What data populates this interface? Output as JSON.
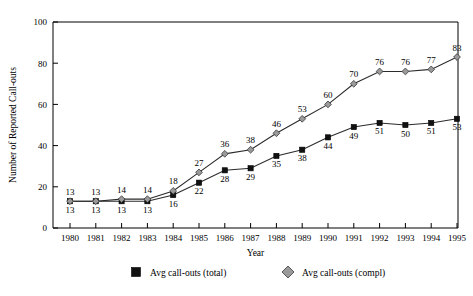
{
  "chart_data": {
    "type": "line",
    "title": "",
    "xlabel": "Year",
    "ylabel": "Number of Reported Call-outs",
    "categories": [
      "1980",
      "1981",
      "1982",
      "1983",
      "1984",
      "1985",
      "1986",
      "1987",
      "1988",
      "1989",
      "1990",
      "1991",
      "1992",
      "1993",
      "1994",
      "1995"
    ],
    "x": [
      1980,
      1981,
      1982,
      1983,
      1984,
      1985,
      1986,
      1987,
      1988,
      1989,
      1990,
      1991,
      1992,
      1993,
      1994,
      1995
    ],
    "xlim": [
      1979.5,
      1995.8
    ],
    "ylim": [
      0,
      100
    ],
    "yticks": [
      0,
      20,
      40,
      60,
      80,
      100
    ],
    "ytick_labels": [
      "0",
      "20",
      "40",
      "60",
      "80",
      "100"
    ],
    "grid": false,
    "legend_position": "bottom",
    "series": [
      {
        "name": "Avg call-outs (total)",
        "marker": "square",
        "marker_color": "#111111",
        "label_position": "below",
        "values": [
          13,
          13,
          13,
          13,
          16,
          22,
          28,
          29,
          35,
          38,
          44,
          49,
          51,
          50,
          51,
          53
        ]
      },
      {
        "name": "Avg call-outs (compl)",
        "marker": "diamond",
        "marker_color": "#9a9a9a",
        "label_position": "above",
        "values": [
          13,
          13,
          14,
          14,
          18,
          27,
          36,
          38,
          46,
          53,
          60,
          70,
          76,
          76,
          77,
          83
        ]
      }
    ]
  },
  "legend": {
    "entries": [
      {
        "label": "Avg call-outs (total)",
        "marker": "square",
        "color": "#111111"
      },
      {
        "label": "Avg call-outs (compl)",
        "marker": "diamond",
        "color": "#9a9a9a"
      }
    ]
  }
}
